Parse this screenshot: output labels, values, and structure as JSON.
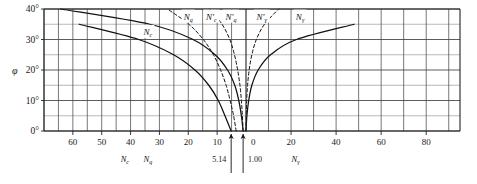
{
  "chart_data": {
    "type": "line",
    "title": "",
    "ylabel": "φ",
    "ylim": [
      0,
      40
    ],
    "ytick_labels": [
      "0°",
      "10°",
      "20°",
      "30°",
      "40°"
    ],
    "ytick_values": [
      0,
      10,
      20,
      30,
      40
    ],
    "grid": true,
    "left_axis": {
      "name_c": "N",
      "name_c_sub": "c",
      "name_q": "N",
      "name_q_sub": "q",
      "tick_labels": [
        "60",
        "50",
        "40",
        "30",
        "20",
        "10"
      ],
      "tick_values": [
        60,
        50,
        40,
        30,
        20,
        10
      ],
      "direction": "decreasing-rightward",
      "max": 70,
      "min": 0
    },
    "right_axis": {
      "name": "N",
      "name_sub": "γ",
      "tick_labels": [
        "0",
        "20",
        "40",
        "60",
        "80"
      ],
      "tick_values": [
        0,
        20,
        40,
        60,
        80
      ],
      "direction": "increasing-rightward",
      "max": 95,
      "min": 0
    },
    "annotations": [
      {
        "text": "5.14",
        "axis": "left",
        "value": 5.14,
        "arrow": true
      },
      {
        "text": "1.00",
        "axis": "left",
        "value": 1.0,
        "arrow": true
      }
    ],
    "legend_position": "inline-curve-labels",
    "series": [
      {
        "name": "N",
        "sub": "c",
        "label": "N_c",
        "style": "solid",
        "side": "left",
        "label_at": {
          "phi": 32.5,
          "value": 34
        },
        "points": [
          {
            "phi": 0,
            "value": 5.14
          },
          {
            "phi": 5,
            "value": 7.3
          },
          {
            "phi": 10,
            "value": 9.6
          },
          {
            "phi": 15,
            "value": 12.9
          },
          {
            "phi": 20,
            "value": 17.7
          },
          {
            "phi": 25,
            "value": 25.1
          },
          {
            "phi": 30,
            "value": 37.2
          },
          {
            "phi": 35,
            "value": 57.8
          },
          {
            "phi": 40,
            "value": 95.7
          }
        ]
      },
      {
        "name": "N",
        "sub": "q",
        "label": "N_q",
        "style": "solid",
        "side": "left",
        "label_at": {
          "phi": 37.5,
          "value": 20
        },
        "points": [
          {
            "phi": 0,
            "value": 1.0
          },
          {
            "phi": 5,
            "value": 1.6
          },
          {
            "phi": 10,
            "value": 2.5
          },
          {
            "phi": 15,
            "value": 3.9
          },
          {
            "phi": 20,
            "value": 6.4
          },
          {
            "phi": 25,
            "value": 10.7
          },
          {
            "phi": 30,
            "value": 18.4
          },
          {
            "phi": 35,
            "value": 33.3
          },
          {
            "phi": 40,
            "value": 64.2
          }
        ]
      },
      {
        "name": "N'",
        "sub": "c",
        "label": "N'_c",
        "style": "dashed",
        "side": "left",
        "label_at": {
          "phi": 37.5,
          "value": 12
        },
        "points": [
          {
            "phi": 0,
            "value": 3.4
          },
          {
            "phi": 5,
            "value": 4.3
          },
          {
            "phi": 10,
            "value": 5.5
          },
          {
            "phi": 15,
            "value": 6.9
          },
          {
            "phi": 20,
            "value": 8.8
          },
          {
            "phi": 25,
            "value": 11.3
          },
          {
            "phi": 30,
            "value": 14.8
          },
          {
            "phi": 35,
            "value": 19.8
          },
          {
            "phi": 40,
            "value": 27.2
          }
        ]
      },
      {
        "name": "N'",
        "sub": "q",
        "label": "N'_q",
        "style": "dashed",
        "side": "left",
        "label_at": {
          "phi": 37.5,
          "value": 5.2
        },
        "points": [
          {
            "phi": 0,
            "value": 1.0
          },
          {
            "phi": 5,
            "value": 1.25
          },
          {
            "phi": 10,
            "value": 1.6
          },
          {
            "phi": 15,
            "value": 2.1
          },
          {
            "phi": 20,
            "value": 2.9
          },
          {
            "phi": 25,
            "value": 4.0
          },
          {
            "phi": 30,
            "value": 5.6
          },
          {
            "phi": 35,
            "value": 8.3
          },
          {
            "phi": 40,
            "value": 12.5
          }
        ]
      },
      {
        "name": "N'",
        "sub": "γ",
        "label": "N'_gamma",
        "style": "dashed",
        "side": "right",
        "label_at": {
          "phi": 37.5,
          "value": 7
        },
        "points": [
          {
            "phi": 0,
            "value": 0.0
          },
          {
            "phi": 5,
            "value": 0.1
          },
          {
            "phi": 10,
            "value": 0.3
          },
          {
            "phi": 15,
            "value": 0.7
          },
          {
            "phi": 20,
            "value": 1.4
          },
          {
            "phi": 25,
            "value": 2.6
          },
          {
            "phi": 30,
            "value": 4.6
          },
          {
            "phi": 35,
            "value": 8.2
          },
          {
            "phi": 40,
            "value": 14.5
          }
        ]
      },
      {
        "name": "N",
        "sub": "γ",
        "label": "N_gamma",
        "style": "solid",
        "side": "right",
        "label_at": {
          "phi": 37.5,
          "value": 24
        },
        "points": [
          {
            "phi": 0,
            "value": 0.0
          },
          {
            "phi": 5,
            "value": 0.4
          },
          {
            "phi": 10,
            "value": 1.2
          },
          {
            "phi": 15,
            "value": 2.6
          },
          {
            "phi": 20,
            "value": 5.4
          },
          {
            "phi": 25,
            "value": 10.9
          },
          {
            "phi": 30,
            "value": 22.4
          },
          {
            "phi": 35,
            "value": 48.0
          },
          {
            "phi": 40,
            "value": 109.0
          }
        ]
      }
    ]
  }
}
